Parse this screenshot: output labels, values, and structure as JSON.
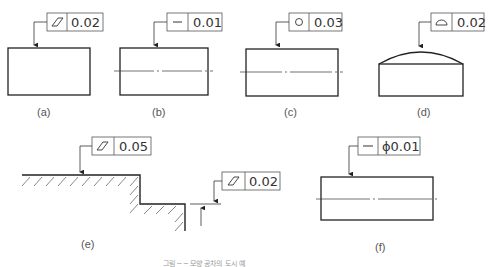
{
  "figures": [
    {
      "id": "a",
      "label": "(a)",
      "symbol": "flatness-icon",
      "tolerance": "0.02"
    },
    {
      "id": "b",
      "label": "(b)",
      "symbol": "straightness-icon",
      "tolerance": "0.01"
    },
    {
      "id": "c",
      "label": "(c)",
      "symbol": "circularity-icon",
      "tolerance": "0.03"
    },
    {
      "id": "d",
      "label": "(d)",
      "symbol": "surface-profile-icon",
      "tolerance": "0.02"
    },
    {
      "id": "e",
      "label": "(e)",
      "symbol": "flatness-icon",
      "tolerance": "0.05",
      "tolerance2": "0.02"
    },
    {
      "id": "f",
      "label": "(f)",
      "symbol": "straightness-icon",
      "tolerance": "ϕ0.01"
    }
  ],
  "caption": "그림 ─ ─ 모양 공차의 도시 예"
}
